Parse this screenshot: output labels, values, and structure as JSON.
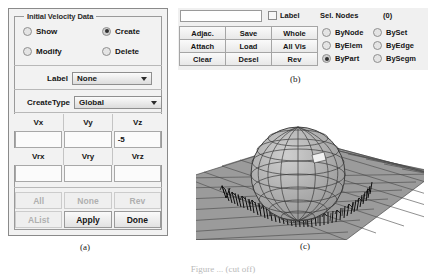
{
  "panel_a": {
    "group_title": "Initial Velocity Data",
    "modes": [
      {
        "label": "Show",
        "selected": false
      },
      {
        "label": "Create",
        "selected": true
      },
      {
        "label": "Modify",
        "selected": false
      },
      {
        "label": "Delete",
        "selected": false
      }
    ],
    "label_field": {
      "label": "Label",
      "value": "None"
    },
    "createtype_field": {
      "label": "CreateType",
      "value": "Global"
    },
    "velocity_headers": [
      "Vx",
      "Vy",
      "Vz"
    ],
    "velocity_values": [
      "",
      "",
      "-5"
    ],
    "rotation_headers": [
      "Vrx",
      "Vry",
      "Vrz"
    ],
    "rotation_values": [
      "",
      "",
      ""
    ],
    "buttons": [
      {
        "label": "All",
        "enabled": false
      },
      {
        "label": "None",
        "enabled": false
      },
      {
        "label": "Rev",
        "enabled": false
      },
      {
        "label": "AList",
        "enabled": false
      },
      {
        "label": "Apply",
        "enabled": true
      },
      {
        "label": "Done",
        "enabled": true
      }
    ]
  },
  "panel_b": {
    "text_input_value": "",
    "label_checkbox": {
      "label": "Label",
      "checked": false
    },
    "sel_nodes_label": "Sel. Nodes",
    "sel_nodes_count": "(0)",
    "buttons": [
      [
        "Adjac.",
        "Save",
        "Whole"
      ],
      [
        "Attach",
        "Load",
        "All Vis"
      ],
      [
        "Clear",
        "Desel",
        "Rev"
      ]
    ],
    "select_modes": [
      {
        "label": "ByNode",
        "selected": false
      },
      {
        "label": "BySet",
        "selected": false
      },
      {
        "label": "ByElem",
        "selected": false
      },
      {
        "label": "ByEdge",
        "selected": false
      },
      {
        "label": "ByPart",
        "selected": true
      },
      {
        "label": "BySegm",
        "selected": false
      }
    ]
  },
  "panel_c": {
    "description": "3D finite-element viewport: gray quad-meshed ground plane with a faceted lat-long sphere resting on it and dense black initial-velocity vector arrows around the contact ring",
    "colors": {
      "plane_fill": "#9a9a9a",
      "plane_line": "#4b4b4b",
      "sphere_fill": "#a8a8a8",
      "sphere_line": "#3a3a3a",
      "vector_arrows": "#101010"
    }
  },
  "captions": {
    "a": "(a)",
    "b": "(b)",
    "c": "(c)",
    "figure": "Figure ... (cut off)"
  }
}
